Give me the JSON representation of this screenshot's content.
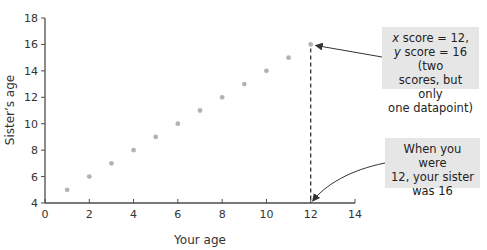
{
  "chart_data": {
    "type": "scatter",
    "title": "",
    "xlabel": "Your age",
    "ylabel": "Sister’s age",
    "xlim": [
      0,
      14
    ],
    "ylim": [
      4,
      18
    ],
    "xticks": [
      0,
      2,
      4,
      6,
      8,
      10,
      12,
      14
    ],
    "yticks": [
      4,
      6,
      8,
      10,
      12,
      14,
      16,
      18
    ],
    "grid": false,
    "series": [
      {
        "name": "Sister's age vs your age",
        "x": [
          1,
          2,
          3,
          4,
          5,
          6,
          7,
          8,
          9,
          10,
          11,
          12
        ],
        "y": [
          5,
          6,
          7,
          8,
          9,
          10,
          11,
          12,
          13,
          14,
          15,
          16
        ],
        "color": "#b3b3b3"
      }
    ],
    "guides": [
      {
        "type": "vertical-dashed",
        "x": 12,
        "from_y": 4,
        "to_y": 16
      }
    ],
    "annotations": [
      {
        "id": "datapoint-callout",
        "lines": [
          "x score = 12,",
          "y score = 16 (two",
          "scores, but only",
          "one datapoint)"
        ],
        "points_to": [
          12,
          16
        ]
      },
      {
        "id": "axis-callout",
        "lines": [
          "When you were",
          "12, your sister",
          "was 16"
        ],
        "points_to": [
          12,
          4
        ]
      }
    ]
  },
  "callouts": {
    "top": {
      "line1_var": "x",
      "line1_rest": " score = 12,",
      "line2_var": "y",
      "line2_rest": " score = 16 (two",
      "line3": "scores, but only",
      "line4": "one datapoint)"
    },
    "bottom": {
      "line1": "When you were",
      "line2": "12, your sister",
      "line3": "was 16"
    }
  },
  "colors": {
    "axis": "#4d4d4d",
    "point": "#b3b3b3",
    "callout_bg": "#e6e6e6",
    "arrow": "#333333"
  }
}
